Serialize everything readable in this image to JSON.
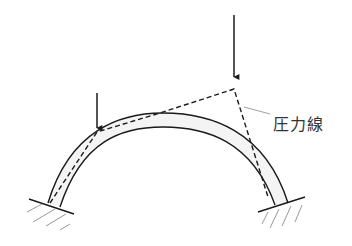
{
  "diagram": {
    "type": "arch-pressure-line",
    "label": "圧力線",
    "elements": {
      "arch": "curved arch with fixed supports at both ends",
      "loads": [
        {
          "name": "small-load",
          "position": "left",
          "direction": "down"
        },
        {
          "name": "large-load",
          "position": "right",
          "direction": "down"
        }
      ],
      "pressure_line": "dashed funicular polygon"
    },
    "colors": {
      "stroke": "#1a1a1a",
      "arch_fill": "#f2f2f2",
      "hatch": "#999999",
      "leader": "#888888",
      "label": "#333333"
    }
  }
}
